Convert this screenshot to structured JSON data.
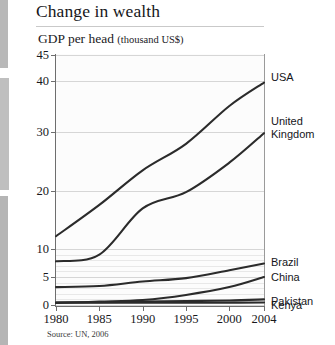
{
  "title": "Change in wealth",
  "subtitle_main": "GDP per head",
  "subtitle_units": "(thousand US$)",
  "source": "Source: UN, 2006",
  "chart_data": {
    "type": "line",
    "title": "Change in wealth",
    "subtitle": "GDP per head (thousand US$)",
    "xlabel": "",
    "ylabel": "GDP per head (thousand US$)",
    "source": "Source: UN, 2006",
    "grid": true,
    "legend_position": "right-of-plot (line-end labels)",
    "x": [
      1980,
      1985,
      1990,
      1995,
      2000,
      2004
    ],
    "xlim": [
      1980,
      2004
    ],
    "xtick_labels": [
      "1980",
      "1985",
      "1990",
      "1995",
      "2000",
      "2004"
    ],
    "ylim": [
      0,
      45
    ],
    "y_scale": "compressed / non-linear (0,5,10,20,30,40,45)",
    "ytick_values": [
      0,
      5,
      10,
      20,
      30,
      40,
      45
    ],
    "ytick_labels": [
      "0",
      "5",
      "10",
      "20",
      "30",
      "40",
      "45"
    ],
    "gridline_values": [
      45,
      40,
      30,
      20,
      10,
      5,
      0
    ],
    "series": [
      {
        "name": "USA",
        "values": [
          12.2,
          17.6,
          23.5,
          28.0,
          35.1,
          39.7
        ]
      },
      {
        "name": "United Kingdom",
        "values": [
          7.8,
          9.0,
          17.0,
          19.8,
          24.8,
          29.8
        ]
      },
      {
        "name": "Brazil",
        "values": [
          3.2,
          3.4,
          4.2,
          4.8,
          6.2,
          7.4
        ]
      },
      {
        "name": "China",
        "values": [
          0.35,
          0.6,
          0.9,
          1.8,
          3.2,
          5.0
        ]
      },
      {
        "name": "Pakistan",
        "values": [
          0.45,
          0.5,
          0.6,
          0.7,
          0.8,
          1.0
        ]
      },
      {
        "name": "Kenya",
        "values": [
          0.45,
          0.42,
          0.4,
          0.4,
          0.42,
          0.45
        ]
      }
    ]
  },
  "end_labels": [
    {
      "name": "USA",
      "text": "USA"
    },
    {
      "name": "United Kingdom",
      "text": "United\nKingdom"
    },
    {
      "name": "Brazil",
      "text": "Brazil"
    },
    {
      "name": "China",
      "text": "China"
    },
    {
      "name": "Pakistan",
      "text": "Pakistan"
    },
    {
      "name": "Kenya",
      "text": "Kenya"
    }
  ],
  "colors": {
    "line": "#2b2b2b",
    "grid": "#d6d6d6",
    "axis": "#6e6e6e",
    "text": "#18181c",
    "plot_bg": "#fcfcfc"
  }
}
